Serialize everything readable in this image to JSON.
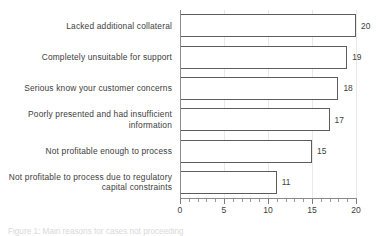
{
  "chart_data": {
    "type": "bar",
    "orientation": "horizontal",
    "title": "",
    "xlabel": "",
    "ylabel": "",
    "categories": [
      "Lacked additional collateral",
      "Completely unsuitable for support",
      "Serious know your customer concerns",
      "Poorly presented and had insufficient information",
      "Not profitable enough to process",
      "Not profitable to process due to regulatory capital constraints"
    ],
    "values": [
      20,
      19,
      18,
      17,
      15,
      11
    ],
    "value_labels": [
      "20",
      "19",
      "18",
      "17",
      "15",
      "11"
    ],
    "xlim": [
      0,
      20
    ],
    "xticks": [
      0,
      5,
      10,
      15,
      20
    ],
    "xtick_labels": [
      "0",
      "5",
      "10",
      "15",
      "20"
    ],
    "minor_tick_step": 1,
    "grid": "vertical-major-only",
    "legend": "none",
    "bar_fill": "#ffffff",
    "bar_outline": "#5c5c5c",
    "gridline_color": "#e9e9e9",
    "axis_color": "#8a8a8a",
    "text_color": "#3d3d3d"
  },
  "caption": {
    "clipped_text": "Figure 1: Main reasons for cases not proceeding"
  }
}
